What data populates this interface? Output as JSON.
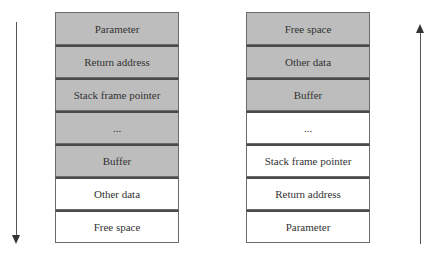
{
  "left_stack": {
    "cells": [
      {
        "label": "Parameter",
        "shaded": true
      },
      {
        "label": "Return address",
        "shaded": true
      },
      {
        "label": "Stack frame pointer",
        "shaded": true
      },
      {
        "label": "...",
        "shaded": true
      },
      {
        "label": "Buffer",
        "shaded": true
      },
      {
        "label": "Other data",
        "shaded": false
      },
      {
        "label": "Free space",
        "shaded": false
      }
    ],
    "arrow_direction": "down"
  },
  "right_stack": {
    "cells": [
      {
        "label": "Free space",
        "shaded": true
      },
      {
        "label": "Other data",
        "shaded": true
      },
      {
        "label": "Buffer",
        "shaded": true
      },
      {
        "label": "...",
        "shaded": false
      },
      {
        "label": "Stack frame pointer",
        "shaded": false
      },
      {
        "label": "Return address",
        "shaded": false
      },
      {
        "label": "Parameter",
        "shaded": false
      }
    ],
    "arrow_direction": "up"
  },
  "colors": {
    "shaded_fill": "#bdbdbd",
    "plain_fill": "#ffffff",
    "border": "#6b6b6b",
    "text": "#333333"
  }
}
